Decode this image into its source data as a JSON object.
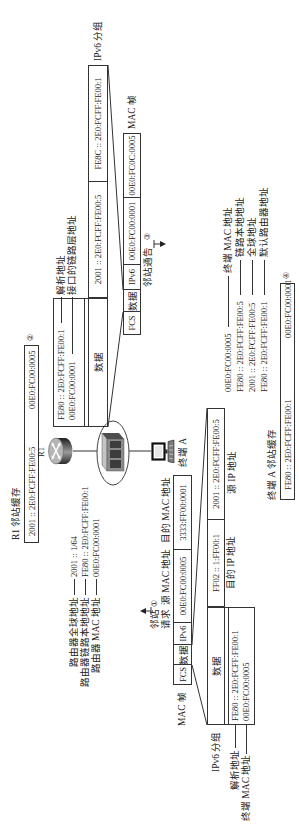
{
  "r1": {
    "name": "R1",
    "cache": {
      "title": "R1 邻站缓存",
      "ip": "2001 :: 2E0:FCFF:FE00:5",
      "mac": "00E0:FC00:0005",
      "step": "②"
    },
    "info": [
      {
        "label": "路由器全球地址",
        "value": "2001 :: 1/64"
      },
      {
        "label": "路由器链路本地地址",
        "value": "FE80 :: 2E0:FCFF:FE00:1"
      },
      {
        "label": "路由器 MAC 地址",
        "value": "00E0:FC00:0001"
      }
    ]
  },
  "terminal": {
    "name": "终端 A",
    "info": [
      {
        "value": "00E0:FC00:0005",
        "label": "终端 MAC 地址"
      },
      {
        "value": "FE80 :: 2E0:FCFF:FE00:5",
        "label": "链路本地地址"
      },
      {
        "value": "2001 :: 2E0:FCFF:FE00:5",
        "label": "全球地址"
      },
      {
        "value": "FE80 :: 2E0:FCFF:FE00:1",
        "label": "默认路由器地址"
      }
    ],
    "cache": {
      "title": "终端 A 邻站缓存",
      "ip": "FE80 :: 2E0:FCFF:FE00:1",
      "mac": "00E0:FC00:0001",
      "step": "④"
    }
  },
  "ns": {
    "label_line1": "邻站",
    "label_line2": "请求",
    "step": "①",
    "mac_frame": {
      "label": "MAC 帧",
      "fields": [
        "FCS",
        "数据",
        "IPv6",
        "00E0:FC00:0005",
        "3333:FF00:0001"
      ],
      "src_label": "源 MAC 地址",
      "dst_label": "目的 MAC 地址"
    },
    "ipv6_packet": {
      "label": "IPv6 分组",
      "fields": [
        "数据",
        "FF02 :: 1:FF00:1",
        "2001 :: 2E0:FCFF:FE00:5"
      ],
      "dst_label": "目的 IP 地址",
      "src_label": "源 IP 地址"
    },
    "data": [
      {
        "value": "FE80 :: 2E0:FCFF:FE00:1",
        "label": "解析地址"
      },
      {
        "value": "00E0:FC00:0005",
        "label": "终端 MAC 地址"
      }
    ]
  },
  "na": {
    "label": "邻站通告",
    "step": "③",
    "mac_frame": {
      "label": "MAC 帧",
      "fields": [
        "FCS",
        "数据",
        "IPv6",
        "00E0:FC00:0001",
        "00E0:FC0C:0005"
      ]
    },
    "ipv6_packet": {
      "label": "IPv6 分组",
      "fields": [
        "数据",
        "2001 :: 2E0:FCFF:FE00:5",
        "FE8C :: 2E0:FCFF:FE00:1"
      ]
    },
    "data": [
      {
        "value": "FE80 :: 2E0:FCFF:FE00:1",
        "label": "解析地址"
      },
      {
        "value": "00E0:FC00:0001",
        "label": "接口的链路层地址"
      }
    ]
  },
  "icons": {
    "router": "router-icon",
    "switch": "switch-icon",
    "terminal": "computer-icon",
    "ns_arrow": "arrow-up-icon",
    "na_arrow": "arrow-down-icon"
  },
  "colors": {
    "line": "#333333",
    "text": "#222222",
    "background": "#ffffff",
    "router_body": "#3a3a3a",
    "switch_body": "#8a8a8a"
  }
}
